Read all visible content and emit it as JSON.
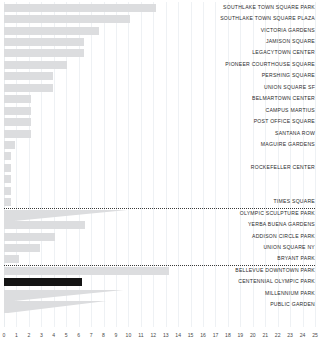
{
  "chart_data": {
    "type": "bar",
    "orientation": "horizontal",
    "title": "",
    "xlabel": "",
    "ylabel": "",
    "xlim": [
      0,
      25
    ],
    "xticks": [
      0,
      1,
      2,
      3,
      4,
      5,
      6,
      7,
      8,
      9,
      10,
      11,
      12,
      13,
      14,
      15,
      16,
      17,
      18,
      19,
      20,
      21,
      22,
      23,
      24,
      25
    ],
    "xticklabels": [
      "0",
      "1",
      "2",
      "3",
      "4",
      "5",
      "6",
      "7",
      "8",
      "9",
      "10",
      "11",
      "12",
      "13",
      "14",
      "15",
      "16",
      "17",
      "18",
      "19",
      "20",
      "21",
      "22",
      "23",
      "24",
      "25"
    ],
    "grid": true,
    "grid_axis": "x",
    "legend": "none",
    "bar_color": "#dcdddf",
    "highlight_color": "#141414",
    "separator_style": "dotted",
    "categories": [
      "SOUTHLAKE TOWN SQUARE PARK",
      "SOUTHLAKE TOWN SQUARE PLAZA",
      "VICTORIA GARDENS",
      "JAMISON SQUARE",
      "LEGACYTOWN CENTER",
      "PIONEER COURTHOUSE SQUARE",
      "PERSHING SQUARE",
      "UNION SQUARE SF",
      "BELMARTOWN CENTER",
      "CAMPUS MARTIUS",
      "POST OFFICE SQUARE",
      "SANTANA ROW",
      "MAGUIRE GARDENS",
      "",
      "ROCKEFELLER CENTER",
      "",
      "",
      "TIMES SQUARE",
      "OLYMPIC SCULPTURE PARK",
      "YERBA BUENA GARDENS",
      "ADDISON CIRCLE PARK",
      "UNION SQUARE NY",
      "BRYANT PARK",
      "BELLEVUE DOWNTOWN PARK",
      "CENTENNIAL OLYMPIC PARK",
      "MILLENNIUM PARK",
      "PUBLIC GARDEN"
    ],
    "values": [
      12.2,
      10.1,
      7.6,
      6.4,
      6.4,
      5.1,
      3.9,
      3.9,
      2.2,
      2.2,
      2.2,
      2.2,
      0.9,
      0.55,
      0.55,
      0.55,
      0.55,
      0.55,
      5.9,
      6.5,
      4.1,
      2.9,
      1.2,
      13.3,
      6.3,
      5.6,
      4.7
    ],
    "highlighted": [
      "CENTENNIAL OLYMPIC PARK"
    ],
    "tapered": [
      "OLYMPIC SCULPTURE PARK",
      "MILLENNIUM PARK",
      "PUBLIC GARDEN"
    ],
    "separators_after": [
      "TIMES SQUARE",
      "BRYANT PARK"
    ]
  }
}
